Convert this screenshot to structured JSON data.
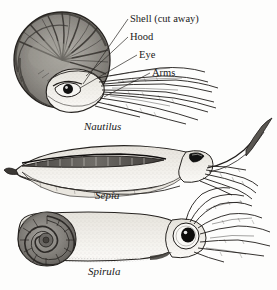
{
  "figure": {
    "kind": "scientific-illustration-plate",
    "background_color": "#fdfdfc",
    "ink_color": "#1a1a1a",
    "shell_tone": "#8e8c88",
    "shell_dark": "#474440",
    "body_tone": "#f2f0ea"
  },
  "labels": {
    "shell": "Shell (cut away)",
    "hood": "Hood",
    "eye": "Eye",
    "arms": "Arms"
  },
  "specimens": [
    {
      "name": "Nautilus",
      "note": "coiled external shell shown cut away"
    },
    {
      "name": "Sepia",
      "note": "internal cuttlebone, lateral fin"
    },
    {
      "name": "Spirula",
      "note": "internal coiled shell at posterior"
    }
  ],
  "captions": {
    "nautilus": "Nautilus",
    "sepia": "Sepia",
    "spirula": "Spirula"
  }
}
